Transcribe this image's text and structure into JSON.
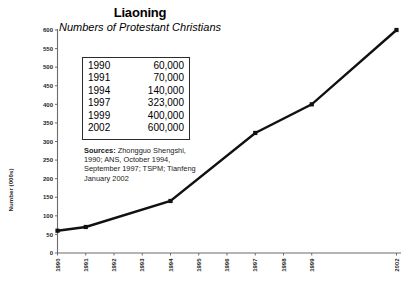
{
  "chart_data": {
    "type": "line",
    "title": "Liaoning",
    "subtitle": "Numbers of Protestant Christians",
    "xlabel": "",
    "ylabel": "Number (000s)",
    "ylim": [
      0,
      600
    ],
    "y_ticks": [
      0,
      50,
      100,
      150,
      200,
      250,
      300,
      350,
      400,
      450,
      500,
      550,
      600
    ],
    "y_tick_labels": [
      "0",
      "50",
      "100",
      "150",
      "200",
      "250",
      "300",
      "350",
      "400",
      "450",
      "500",
      "550",
      "600"
    ],
    "x_ticks": [
      "1990",
      "1991",
      "1992",
      "1993",
      "1994",
      "1995",
      "1996",
      "1997",
      "1998",
      "1999",
      "2002"
    ],
    "grid": false,
    "legend": "none",
    "x": [
      1990,
      1991,
      1994,
      1997,
      1999,
      2002
    ],
    "values": [
      60,
      70,
      140,
      323,
      400,
      600
    ],
    "series": [
      {
        "name": "Protestant Christians (000s)",
        "points": [
          {
            "year": "1990",
            "value_thousands": 60,
            "value_label": "60,000"
          },
          {
            "year": "1991",
            "value_thousands": 70,
            "value_label": "70,000"
          },
          {
            "year": "1994",
            "value_thousands": 140,
            "value_label": "140,000"
          },
          {
            "year": "1997",
            "value_thousands": 323,
            "value_label": "323,000"
          },
          {
            "year": "1999",
            "value_thousands": 400,
            "value_label": "400,000"
          },
          {
            "year": "2002",
            "value_thousands": 600,
            "value_label": "600,000"
          }
        ]
      }
    ],
    "colors": {
      "line": "#111111",
      "marker": "#111111",
      "axis": "#6b6b6b",
      "text": "#000000",
      "table_border": "#2b2b2b",
      "background": "#ffffff"
    }
  },
  "table": {
    "rows": [
      {
        "year": "1990",
        "value": "60,000"
      },
      {
        "year": "1991",
        "value": "70,000"
      },
      {
        "year": "1994",
        "value": "140,000"
      },
      {
        "year": "1997",
        "value": "323,000"
      },
      {
        "year": "1999",
        "value": "400,000"
      },
      {
        "year": "2002",
        "value": "600,000"
      }
    ]
  },
  "sources": {
    "label": "Sources:",
    "text": " Zhongguo Shengshi, 1990; ANS, October 1994, September 1997; TSPM; Tianfeng January 2002"
  }
}
